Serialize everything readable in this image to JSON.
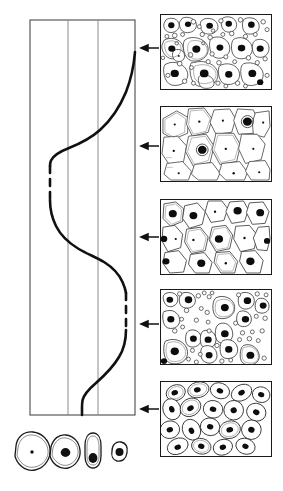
{
  "figure": {
    "line_color": "#111111",
    "grid_color": "#888888",
    "background": "#ffffff"
  },
  "chart_data": {
    "type": "line",
    "title": "",
    "xlabel": "",
    "ylabel": "",
    "xlim": [
      0,
      100
    ],
    "ylim": [
      0,
      100
    ],
    "grid": true,
    "grid_orientation": "vertical",
    "gridlines_x": [
      0,
      37,
      65,
      100
    ],
    "legend": "none",
    "axis_box": {
      "left_px": 30,
      "right_px": 135,
      "top_px": 20,
      "bottom_px": 415
    },
    "series": [
      {
        "name": "maturation-curve",
        "style": "mixed-solid-dashed",
        "points_px": [
          [
            135,
            55
          ],
          [
            128,
            70
          ],
          [
            118,
            95
          ],
          [
            103,
            122
          ],
          [
            88,
            140
          ],
          [
            68,
            150
          ],
          [
            55,
            158
          ],
          [
            50,
            166
          ],
          [
            50,
            200
          ],
          [
            52,
            212
          ],
          [
            62,
            232
          ],
          [
            78,
            248
          ],
          [
            98,
            258
          ],
          [
            114,
            272
          ],
          [
            124,
            288
          ],
          [
            126,
            293
          ],
          [
            126,
            330
          ],
          [
            124,
            343
          ],
          [
            115,
            362
          ],
          [
            100,
            380
          ],
          [
            86,
            394
          ],
          [
            82,
            402
          ],
          [
            82,
            415
          ]
        ],
        "dashed_segments_px": [
          [
            166,
            200
          ],
          [
            293,
            330
          ]
        ]
      }
    ]
  },
  "panels": [
    {
      "id": "panel-1",
      "label": "field-1-atrophic-parabasal-and-inflammatory",
      "box_px": {
        "x": 160,
        "y": 14,
        "w": 112,
        "h": 76
      },
      "arrow": {
        "from_px": [
          160,
          48
        ],
        "to_px": [
          137,
          48
        ],
        "direction": "left"
      },
      "content": "dense mixed field: many medium cells with large dark nuclei plus numerous small clear round cells",
      "cell_count": 22,
      "small_circle_count": 38,
      "nucleus_style": "large-dark"
    },
    {
      "id": "panel-2",
      "label": "field-2-superficial-squamous",
      "box_px": {
        "x": 160,
        "y": 106,
        "w": 112,
        "h": 76
      },
      "arrow": {
        "from_px": [
          160,
          146
        ],
        "to_px": [
          137,
          146
        ],
        "direction": "left"
      },
      "content": "large pale polygonal squamous cells with small pyknotic nuclei",
      "cell_count": 11,
      "small_circle_count": 0,
      "nucleus_style": "small-dot"
    },
    {
      "id": "panel-3",
      "label": "field-3-intermediate-squamous",
      "box_px": {
        "x": 160,
        "y": 199,
        "w": 112,
        "h": 76
      },
      "arrow": {
        "from_px": [
          160,
          237
        ],
        "to_px": [
          137,
          237
        ],
        "direction": "left"
      },
      "content": "medium polygonal cells, mixture of small dot nuclei and larger dark nuclei",
      "cell_count": 14,
      "small_circle_count": 0,
      "nucleus_style": "mixed"
    },
    {
      "id": "panel-4",
      "label": "field-4-atrophic-mixed",
      "box_px": {
        "x": 160,
        "y": 289,
        "w": 112,
        "h": 76
      },
      "arrow": {
        "from_px": [
          160,
          324
        ],
        "to_px": [
          137,
          324
        ],
        "direction": "left"
      },
      "content": "scattered small and medium cells with dark nuclei among many small clear round cells",
      "cell_count": 20,
      "small_circle_count": 34,
      "nucleus_style": "large-dark"
    },
    {
      "id": "panel-5",
      "label": "field-5-parabasal",
      "box_px": {
        "x": 160,
        "y": 381,
        "w": 112,
        "h": 76
      },
      "arrow": {
        "from_px": [
          160,
          409
        ],
        "to_px": [
          137,
          409
        ],
        "direction": "left"
      },
      "content": "crowded oval to elongated parabasal cells each with a single dark nucleus",
      "cell_count": 19,
      "small_circle_count": 0,
      "nucleus_style": "dark-oval"
    }
  ],
  "legend_cells": [
    {
      "id": "legend-cell-1",
      "label": "large-superficial-cell",
      "center_px": [
        31,
        452
      ],
      "radius_px": 19,
      "nucleus": "pin-dot",
      "nucleus_radius_px": 1.6
    },
    {
      "id": "legend-cell-2",
      "label": "intermediate-cell",
      "center_px": [
        64,
        452
      ],
      "radius_px": 15,
      "nucleus": "dark-round",
      "nucleus_radius_px": 4.5
    },
    {
      "id": "legend-cell-3",
      "label": "parabasal-cell",
      "center_px": [
        92,
        450
      ],
      "radius_px": 9,
      "nucleus": "dark-round",
      "nucleus_radius_px": 4.5
    },
    {
      "id": "legend-cell-4",
      "label": "basal-cell",
      "center_px": [
        119,
        453
      ],
      "radius_px": 8,
      "nucleus": "dark-round",
      "nucleus_radius_px": 4.0
    }
  ]
}
